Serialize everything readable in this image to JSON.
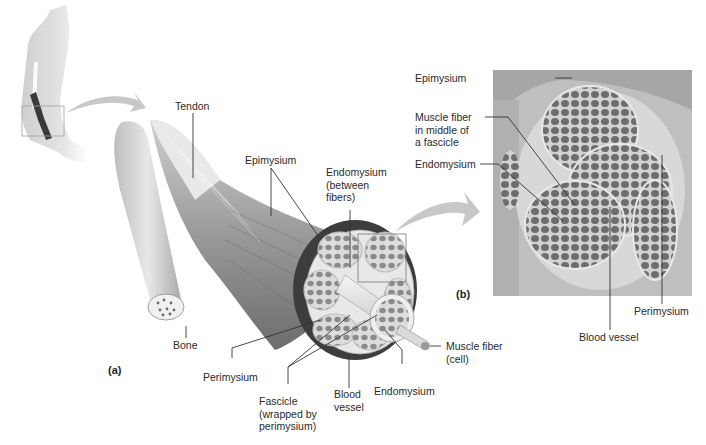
{
  "figure": {
    "panels": [
      {
        "id": "a",
        "label": "(a)"
      },
      {
        "id": "b",
        "label": "(b)"
      }
    ]
  },
  "labels_a": {
    "tendon": "Tendon",
    "epimysium": "Epimysium",
    "endomysium_between": "Endomysium\n(between\nfibers)",
    "bone": "Bone",
    "perimysium": "Perimysium",
    "fascicle": "Fascicle\n(wrapped by\nperimysium)",
    "blood_vessel": "Blood\nvessel",
    "endomysium": "Endomysium",
    "muscle_fiber": "Muscle fiber\n(cell)"
  },
  "labels_b": {
    "epimysium": "Epimysium",
    "muscle_fiber_middle": "Muscle fiber\nin middle of\na fascicle",
    "endomysium": "Endomysium",
    "blood_vessel": "Blood vessel",
    "perimysium": "Perimysium"
  },
  "colors": {
    "label_text": "#2a2a2a",
    "leader_line": "#333333",
    "arrow_fill": "#c8c8c8",
    "muscle_dark": "#4a4a4a",
    "tissue_light": "#e6e6e6",
    "micrograph_bg": "#b9b9b9",
    "fiber_fill": "#6a6a6a"
  }
}
